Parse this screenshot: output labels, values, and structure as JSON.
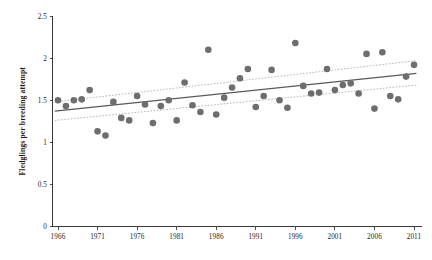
{
  "chart_data": {
    "type": "scatter",
    "title": "",
    "xlabel": "",
    "ylabel": "Fledglings per breeding attempt",
    "xlim": [
      1965,
      2011.5
    ],
    "ylim": [
      0,
      2.5
    ],
    "grid": false,
    "legend": null,
    "xticks": [
      1966,
      1971,
      1976,
      1981,
      1986,
      1991,
      1996,
      2001,
      2006,
      2011
    ],
    "xtick_labels": [
      "1966",
      "1971",
      "1976",
      "1981",
      "1986",
      "1991",
      "1996",
      "2001",
      "2006",
      "2011"
    ],
    "yticks": [
      0,
      0.5,
      1,
      1.5,
      2,
      2.5
    ],
    "ytick_labels": [
      "0",
      "0.5",
      "1",
      "1.5",
      "2",
      "2.5"
    ],
    "point_color": "#6e6e6e",
    "trend_color": "#5a5a5a",
    "ci_color": "#a9a9a9",
    "points": [
      {
        "x": 1966,
        "y": 1.5
      },
      {
        "x": 1967,
        "y": 1.43
      },
      {
        "x": 1968,
        "y": 1.5
      },
      {
        "x": 1969,
        "y": 1.51
      },
      {
        "x": 1970,
        "y": 1.62
      },
      {
        "x": 1971,
        "y": 1.13
      },
      {
        "x": 1972,
        "y": 1.08
      },
      {
        "x": 1973,
        "y": 1.48
      },
      {
        "x": 1974,
        "y": 1.29
      },
      {
        "x": 1975,
        "y": 1.26
      },
      {
        "x": 1976,
        "y": 1.55
      },
      {
        "x": 1977,
        "y": 1.45
      },
      {
        "x": 1978,
        "y": 1.23
      },
      {
        "x": 1979,
        "y": 1.43
      },
      {
        "x": 1980,
        "y": 1.5
      },
      {
        "x": 1981,
        "y": 1.26
      },
      {
        "x": 1982,
        "y": 1.71
      },
      {
        "x": 1983,
        "y": 1.44
      },
      {
        "x": 1984,
        "y": 1.36
      },
      {
        "x": 1985,
        "y": 2.1
      },
      {
        "x": 1986,
        "y": 1.33
      },
      {
        "x": 1987,
        "y": 1.53
      },
      {
        "x": 1988,
        "y": 1.65
      },
      {
        "x": 1989,
        "y": 1.76
      },
      {
        "x": 1990,
        "y": 1.87
      },
      {
        "x": 1991,
        "y": 1.42
      },
      {
        "x": 1992,
        "y": 1.55
      },
      {
        "x": 1993,
        "y": 1.86
      },
      {
        "x": 1994,
        "y": 1.5
      },
      {
        "x": 1995,
        "y": 1.41
      },
      {
        "x": 1996,
        "y": 2.18
      },
      {
        "x": 1997,
        "y": 1.67
      },
      {
        "x": 1998,
        "y": 1.58
      },
      {
        "x": 1999,
        "y": 1.59
      },
      {
        "x": 2000,
        "y": 1.87
      },
      {
        "x": 2001,
        "y": 1.62
      },
      {
        "x": 2002,
        "y": 1.68
      },
      {
        "x": 2003,
        "y": 1.7
      },
      {
        "x": 2004,
        "y": 1.58
      },
      {
        "x": 2005,
        "y": 2.05
      },
      {
        "x": 2006,
        "y": 1.4
      },
      {
        "x": 2007,
        "y": 2.07
      },
      {
        "x": 2008,
        "y": 1.55
      },
      {
        "x": 2009,
        "y": 1.51
      },
      {
        "x": 2010,
        "y": 1.78
      },
      {
        "x": 2011,
        "y": 1.92
      }
    ],
    "trend_line": {
      "x_start": 1965.6,
      "y_start": 1.37,
      "x_end": 2011.3,
      "y_end": 1.82
    },
    "ci_upper": {
      "x_start": 1965.6,
      "y_start": 1.48,
      "x_end": 2011.3,
      "y_end": 1.97
    },
    "ci_lower": {
      "x_start": 1965.6,
      "y_start": 1.26,
      "x_end": 2011.3,
      "y_end": 1.68
    }
  }
}
